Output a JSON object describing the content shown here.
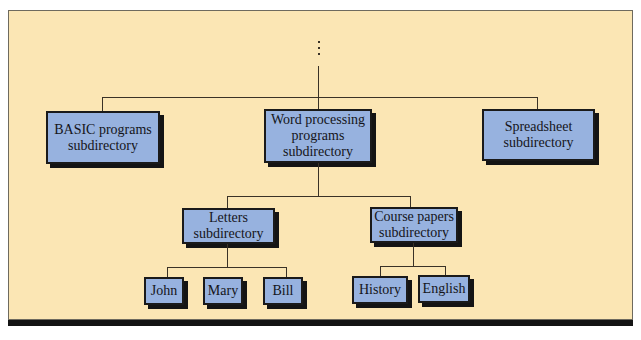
{
  "diagram": {
    "ellipsis": "⋮",
    "colors": {
      "background": "#fbe6b4",
      "node_fill": "#97b2df",
      "line": "#3a3226",
      "shadow": "#141414"
    },
    "level1": [
      {
        "id": "basic",
        "label": "BASIC programs\nsubdirectory"
      },
      {
        "id": "word",
        "label": "Word processing\nprograms\nsubdirectory"
      },
      {
        "id": "spreadsheet",
        "label": "Spreadsheet\nsubdirectory"
      }
    ],
    "level2": [
      {
        "id": "letters",
        "label": "Letters\nsubdirectory",
        "parent": "word"
      },
      {
        "id": "course",
        "label": "Course papers\nsubdirectory",
        "parent": "word"
      }
    ],
    "level3": [
      {
        "id": "john",
        "label": "John",
        "parent": "letters"
      },
      {
        "id": "mary",
        "label": "Mary",
        "parent": "letters"
      },
      {
        "id": "bill",
        "label": "Bill",
        "parent": "letters"
      },
      {
        "id": "history",
        "label": "History",
        "parent": "course"
      },
      {
        "id": "english",
        "label": "English",
        "parent": "course"
      }
    ]
  }
}
